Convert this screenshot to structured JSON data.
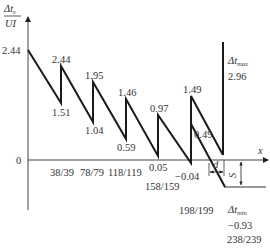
{
  "diagram": {
    "type": "sawtooth-timing-error",
    "y_axis": {
      "label_numerator": "Δt",
      "label_numerator_sub": "s",
      "label_denominator": "UI",
      "zero_label": "0"
    },
    "x_axis": {
      "label": "x"
    },
    "x_ticks": [
      "38/39",
      "78/79",
      "118/119",
      "158/159",
      "198/199",
      "238/239"
    ],
    "peaks": [
      {
        "label": "2.44",
        "role": "start"
      },
      {
        "label": "2.44"
      },
      {
        "label": "1.95"
      },
      {
        "label": "1.46"
      },
      {
        "label": "0.97"
      },
      {
        "label": "1.49"
      }
    ],
    "troughs": [
      "1.51",
      "1.04",
      "0.59",
      "0.05",
      "-0.04",
      "0.49"
    ],
    "dt_max": {
      "label": "Δt",
      "sub": "max",
      "value": "2.96"
    },
    "dt_min": {
      "label": "Δt",
      "sub": "min",
      "value": "−0.93"
    },
    "dimension_d": "d",
    "dimension_s": "S",
    "colors": {
      "line": "#1a1a1a",
      "axis": "#333333",
      "text": "#333333"
    }
  },
  "labels": {
    "y0": "0",
    "start": "2.44",
    "p1": "2.44",
    "t1": "1.51",
    "p2": "1.95",
    "t2": "1.04",
    "p3": "1.46",
    "t3": "0.59",
    "p4": "0.97",
    "t4": "0.05",
    "p5": "1.49",
    "t5": "−0.04",
    "t6": "0.49",
    "x1": "38/39",
    "x2": "78/79",
    "x3": "118/119",
    "x4": "158/159",
    "x5": "198/199",
    "x6": "238/239",
    "dtmax_value": "2.96",
    "dtmin_value": "−0.93",
    "x_axis": "x",
    "d": "d",
    "s": "S",
    "dt": "Δt",
    "max": "max",
    "min": "min",
    "ylabel_num": "Δt",
    "ylabel_sub": "s",
    "ylabel_den": "UI"
  }
}
